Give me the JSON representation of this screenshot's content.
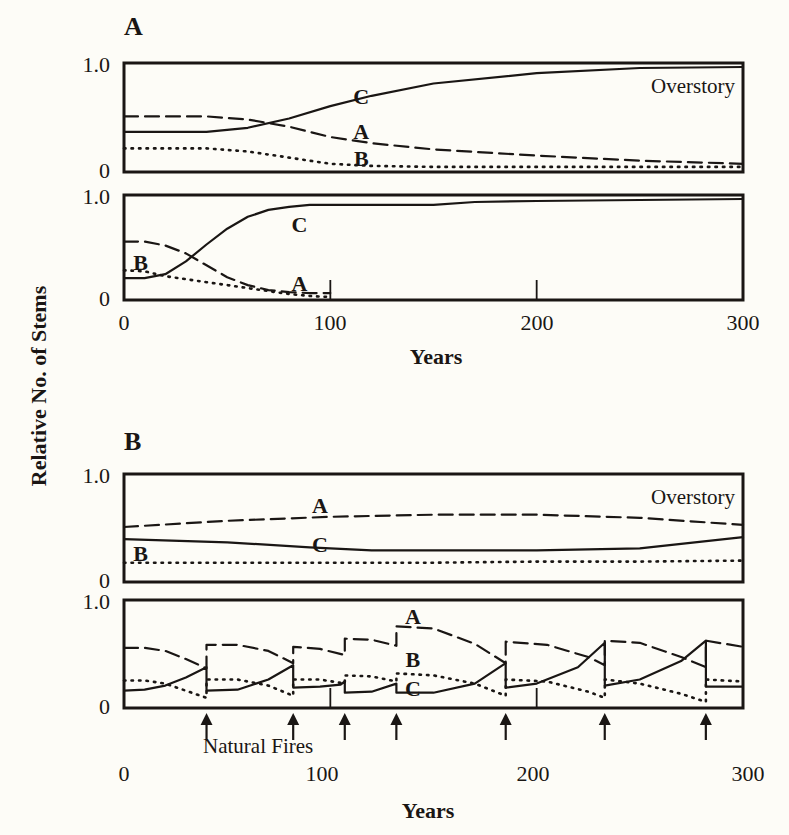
{
  "figure": {
    "ylabel": "Relative No. of Stems",
    "xlabel": "Years",
    "panel_a_label": "A",
    "panel_b_label": "B",
    "fires_label": "Natural Fires",
    "x_ticks": [
      "0",
      "100",
      "200",
      "300"
    ],
    "y_ticks": [
      "0",
      "1.0"
    ],
    "overstory_label": "Overstory",
    "understory_label": "Understory (<4\" d.b.h.)",
    "ink_color": "#1a1614",
    "background_color": "#fdfcf7"
  },
  "chart_data": [
    {
      "id": "A-overstory",
      "type": "line",
      "title": "Overstory",
      "panel": "A",
      "xlabel": "Years",
      "ylabel": "Relative No. of Stems",
      "xlim": [
        0,
        300
      ],
      "ylim": [
        0,
        1.0
      ],
      "x_ticks": [
        0,
        100,
        200,
        300
      ],
      "y_ticks": [
        0,
        1.0
      ],
      "grid": false,
      "series": [
        {
          "name": "A",
          "style": "dashed",
          "x": [
            0,
            40,
            60,
            80,
            100,
            120,
            150,
            200,
            250,
            300
          ],
          "y": [
            0.52,
            0.52,
            0.49,
            0.42,
            0.32,
            0.26,
            0.2,
            0.14,
            0.09,
            0.06
          ]
        },
        {
          "name": "B",
          "style": "dotted",
          "x": [
            0,
            40,
            60,
            80,
            100,
            120,
            150,
            200,
            250,
            300
          ],
          "y": [
            0.21,
            0.21,
            0.18,
            0.12,
            0.06,
            0.04,
            0.03,
            0.03,
            0.03,
            0.03
          ]
        },
        {
          "name": "C",
          "style": "solid",
          "x": [
            0,
            40,
            60,
            80,
            100,
            120,
            150,
            200,
            250,
            300
          ],
          "y": [
            0.37,
            0.37,
            0.41,
            0.5,
            0.62,
            0.72,
            0.84,
            0.94,
            0.99,
            1.0
          ]
        }
      ],
      "annotations": [
        {
          "text": "C",
          "x": 115,
          "y": 0.72
        },
        {
          "text": "A",
          "x": 115,
          "y": 0.38
        },
        {
          "text": "B",
          "x": 115,
          "y": 0.12
        },
        {
          "text": "Overstory",
          "x": 290,
          "y": 0.8
        }
      ]
    },
    {
      "id": "A-understory",
      "type": "line",
      "title": "Understory (<4\" d.b.h.)",
      "panel": "A",
      "xlabel": "Years",
      "ylabel": "Relative No. of Stems",
      "xlim": [
        0,
        300
      ],
      "ylim": [
        0,
        1.0
      ],
      "x_ticks": [
        0,
        100,
        200,
        300
      ],
      "y_ticks": [
        0,
        1.0
      ],
      "grid": false,
      "series": [
        {
          "name": "A",
          "style": "dashed",
          "x": [
            0,
            10,
            20,
            30,
            40,
            50,
            60,
            70,
            80,
            90,
            100
          ],
          "y": [
            0.57,
            0.57,
            0.53,
            0.45,
            0.33,
            0.21,
            0.13,
            0.08,
            0.06,
            0.05,
            0.05
          ]
        },
        {
          "name": "B",
          "style": "dotted",
          "x": [
            0,
            10,
            20,
            30,
            40,
            50,
            60,
            70,
            80,
            90,
            100
          ],
          "y": [
            0.28,
            0.27,
            0.22,
            0.19,
            0.16,
            0.13,
            0.1,
            0.07,
            0.04,
            0.02,
            0.01
          ]
        },
        {
          "name": "C",
          "style": "solid",
          "x": [
            0,
            10,
            20,
            30,
            40,
            50,
            60,
            70,
            80,
            90,
            100,
            150,
            170,
            200,
            300
          ],
          "y": [
            0.2,
            0.2,
            0.24,
            0.37,
            0.54,
            0.7,
            0.82,
            0.89,
            0.92,
            0.94,
            0.94,
            0.94,
            0.97,
            0.98,
            1.0
          ]
        }
      ],
      "annotations": [
        {
          "text": "B",
          "x": 8,
          "y": 0.36
        },
        {
          "text": "C",
          "x": 85,
          "y": 0.75
        },
        {
          "text": "A",
          "x": 85,
          "y": 0.15
        },
        {
          "text": "tick",
          "x": 100
        },
        {
          "text": "tick",
          "x": 200
        }
      ]
    },
    {
      "id": "B-overstory",
      "type": "line",
      "title": "Overstory",
      "panel": "B",
      "xlabel": "Years",
      "ylabel": "Relative No. of Stems",
      "xlim": [
        0,
        300
      ],
      "ylim": [
        0,
        1.0
      ],
      "x_ticks": [
        0,
        100,
        200,
        300
      ],
      "y_ticks": [
        0,
        1.0
      ],
      "grid": false,
      "series": [
        {
          "name": "A",
          "style": "dashed",
          "x": [
            0,
            50,
            100,
            150,
            200,
            250,
            300
          ],
          "y": [
            0.52,
            0.58,
            0.62,
            0.64,
            0.64,
            0.61,
            0.54
          ]
        },
        {
          "name": "B",
          "style": "dotted",
          "x": [
            0,
            50,
            100,
            150,
            200,
            250,
            300
          ],
          "y": [
            0.17,
            0.17,
            0.17,
            0.17,
            0.18,
            0.18,
            0.19
          ]
        },
        {
          "name": "C",
          "style": "solid",
          "x": [
            0,
            50,
            90,
            120,
            150,
            200,
            250,
            300
          ],
          "y": [
            0.4,
            0.37,
            0.32,
            0.29,
            0.29,
            0.29,
            0.31,
            0.42
          ]
        }
      ],
      "annotations": [
        {
          "text": "A",
          "x": 95,
          "y": 0.74
        },
        {
          "text": "C",
          "x": 95,
          "y": 0.35
        },
        {
          "text": "B",
          "x": 8,
          "y": 0.26
        },
        {
          "text": "Overstory",
          "x": 290,
          "y": 0.8
        }
      ]
    },
    {
      "id": "B-understory",
      "type": "line",
      "title": "Understory (<4\" d.b.h.)",
      "panel": "B",
      "xlabel": "Years",
      "ylabel": "Relative No. of Stems",
      "xlim": [
        0,
        300
      ],
      "ylim": [
        0,
        1.0
      ],
      "x_ticks": [
        0,
        100,
        200,
        300
      ],
      "y_ticks": [
        0,
        1.0
      ],
      "grid": false,
      "fire_years": [
        40,
        82,
        107,
        132,
        185,
        233,
        282
      ],
      "series": [
        {
          "name": "A",
          "style": "dashed",
          "x": [
            0,
            10,
            20,
            30,
            40,
            40,
            55,
            70,
            82,
            82,
            95,
            107,
            107,
            120,
            132,
            132,
            150,
            170,
            185,
            185,
            205,
            225,
            233,
            233,
            250,
            270,
            282,
            282,
            300
          ],
          "y": [
            0.57,
            0.57,
            0.54,
            0.46,
            0.37,
            0.6,
            0.6,
            0.54,
            0.42,
            0.58,
            0.56,
            0.5,
            0.66,
            0.65,
            0.59,
            0.78,
            0.76,
            0.61,
            0.42,
            0.63,
            0.6,
            0.48,
            0.4,
            0.64,
            0.62,
            0.48,
            0.38,
            0.64,
            0.58
          ]
        },
        {
          "name": "B",
          "style": "dotted",
          "x": [
            0,
            10,
            20,
            30,
            40,
            40,
            55,
            70,
            82,
            82,
            95,
            107,
            107,
            120,
            132,
            132,
            150,
            170,
            185,
            185,
            205,
            225,
            233,
            233,
            250,
            270,
            282,
            282,
            300
          ],
          "y": [
            0.25,
            0.25,
            0.22,
            0.15,
            0.08,
            0.26,
            0.26,
            0.2,
            0.1,
            0.26,
            0.26,
            0.22,
            0.3,
            0.29,
            0.24,
            0.32,
            0.3,
            0.22,
            0.1,
            0.26,
            0.24,
            0.14,
            0.08,
            0.26,
            0.22,
            0.12,
            0.04,
            0.26,
            0.24
          ]
        },
        {
          "name": "C",
          "style": "solid",
          "x": [
            0,
            10,
            20,
            30,
            40,
            40,
            55,
            70,
            82,
            82,
            95,
            105,
            107,
            107,
            120,
            132,
            132,
            150,
            170,
            185,
            185,
            200,
            220,
            233,
            233,
            250,
            270,
            282,
            282,
            300
          ],
          "y": [
            0.15,
            0.16,
            0.2,
            0.28,
            0.38,
            0.15,
            0.16,
            0.26,
            0.4,
            0.18,
            0.19,
            0.21,
            0.24,
            0.13,
            0.14,
            0.22,
            0.13,
            0.13,
            0.22,
            0.42,
            0.18,
            0.22,
            0.38,
            0.62,
            0.2,
            0.26,
            0.44,
            0.64,
            0.19,
            0.19
          ]
        }
      ],
      "annotations": [
        {
          "text": "A",
          "x": 140,
          "y": 0.88
        },
        {
          "text": "B",
          "x": 140,
          "y": 0.46
        },
        {
          "text": "C",
          "x": 140,
          "y": 0.18
        },
        {
          "text": "tick",
          "x": 100
        },
        {
          "text": "tick",
          "x": 200
        }
      ]
    }
  ]
}
